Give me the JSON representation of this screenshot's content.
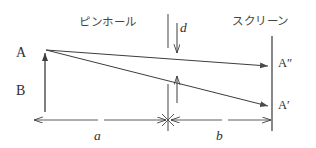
{
  "figure": {
    "stroke_color": "#3d3d3d",
    "background": "#ffffff",
    "labels": {
      "pinhole": "ピンホール",
      "screen": "スクリーン",
      "object_top": "A",
      "object_bottom": "B",
      "image_upper": "A″",
      "image_lower": "A′",
      "aperture_size": "d",
      "distance_object": "a",
      "distance_image": "b"
    },
    "geometry": {
      "object_x": 45,
      "object_top_y": 52,
      "object_bottom_y": 112,
      "pinhole_x": 168,
      "pinhole_gap_top_y": 48,
      "pinhole_gap_bottom_y": 84,
      "screen_x": 272,
      "screen_top_y": 36,
      "screen_bottom_y": 130,
      "image_upper_y": 66,
      "image_lower_y": 106,
      "dimension_line_y": 120
    }
  }
}
